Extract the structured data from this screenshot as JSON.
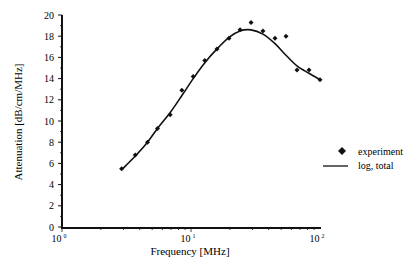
{
  "chart_data": {
    "type": "line",
    "title": "",
    "xlabel": "Frequency [MHz]",
    "ylabel": "Attenuation [dB/cm/MHz]",
    "xscale": "log",
    "xlim": [
      1,
      100
    ],
    "ylim": [
      0,
      20
    ],
    "grid": false,
    "legend_position": "right",
    "x_ticks": [
      {
        "base": "10",
        "exp": "0",
        "value": 1
      },
      {
        "base": "10",
        "exp": "1",
        "value": 10
      },
      {
        "base": "10",
        "exp": "2",
        "value": 100
      }
    ],
    "y_ticks": [
      "0",
      "2",
      "4",
      "6",
      "8",
      "10",
      "12",
      "14",
      "16",
      "18",
      "20"
    ],
    "series": [
      {
        "name": "experiment",
        "style": "markers",
        "marker": "diamond",
        "x": [
          2.9,
          3.7,
          4.6,
          5.5,
          6.9,
          8.5,
          10.4,
          12.8,
          15.9,
          19.7,
          24.0,
          29.2,
          36.1,
          44.8,
          54.5,
          66.3,
          82.2,
          100
        ],
        "y": [
          5.5,
          6.8,
          8.0,
          9.3,
          10.6,
          12.9,
          14.2,
          15.7,
          16.8,
          17.8,
          18.6,
          19.3,
          18.5,
          17.8,
          18.0,
          14.8,
          14.8,
          13.9
        ]
      },
      {
        "name": "log, total",
        "style": "line",
        "x": [
          2.9,
          3.7,
          4.6,
          5.5,
          6.9,
          8.5,
          10.4,
          12.8,
          15.9,
          19.7,
          24.0,
          29.2,
          36.1,
          44.8,
          54.5,
          66.3,
          82.2,
          100
        ],
        "y": [
          5.4,
          6.7,
          8.0,
          9.3,
          10.8,
          12.4,
          14.0,
          15.5,
          16.8,
          17.9,
          18.5,
          18.6,
          18.2,
          17.3,
          16.2,
          15.2,
          14.5,
          13.9
        ]
      }
    ]
  },
  "legend": {
    "items": [
      {
        "label": "experiment",
        "symbol": "diamond"
      },
      {
        "label": "log, total",
        "symbol": "line"
      }
    ]
  }
}
